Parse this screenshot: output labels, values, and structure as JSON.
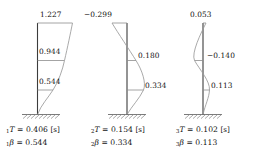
{
  "figure": {
    "type": "structural-mode-shape-diagram",
    "stories": 3,
    "line_color": "#9a9a9a",
    "column_color": "#3c3c3c",
    "text_color": "#111111"
  },
  "modes": [
    {
      "id": "mode-1",
      "index_label": "1",
      "amplitude_labels": [
        "1.227",
        "0.944",
        "0.544"
      ],
      "amplitudes": [
        1.227,
        0.944,
        0.544
      ],
      "caption": {
        "period_symbol": "T",
        "period_eq": "=",
        "period_value": "0.406",
        "period_unit": "[s]",
        "beta_symbol": "β",
        "beta_eq": "=",
        "beta_value": "0.544"
      }
    },
    {
      "id": "mode-2",
      "index_label": "2",
      "amplitude_labels": [
        "−0.299",
        "0.180",
        "0.334"
      ],
      "amplitudes": [
        -0.299,
        0.18,
        0.334
      ],
      "caption": {
        "period_symbol": "T",
        "period_eq": "=",
        "period_value": "0.154",
        "period_unit": "[s]",
        "beta_symbol": "β",
        "beta_eq": "=",
        "beta_value": "0.334"
      }
    },
    {
      "id": "mode-3",
      "index_label": "3",
      "amplitude_labels": [
        "0.053",
        "−0.140",
        "0.113"
      ],
      "amplitudes": [
        0.053,
        -0.14,
        0.113
      ],
      "caption": {
        "period_symbol": "T",
        "period_eq": "=",
        "period_value": "0.102",
        "period_unit": "[s]",
        "beta_symbol": "β",
        "beta_eq": "=",
        "beta_value": "0.113"
      }
    }
  ]
}
